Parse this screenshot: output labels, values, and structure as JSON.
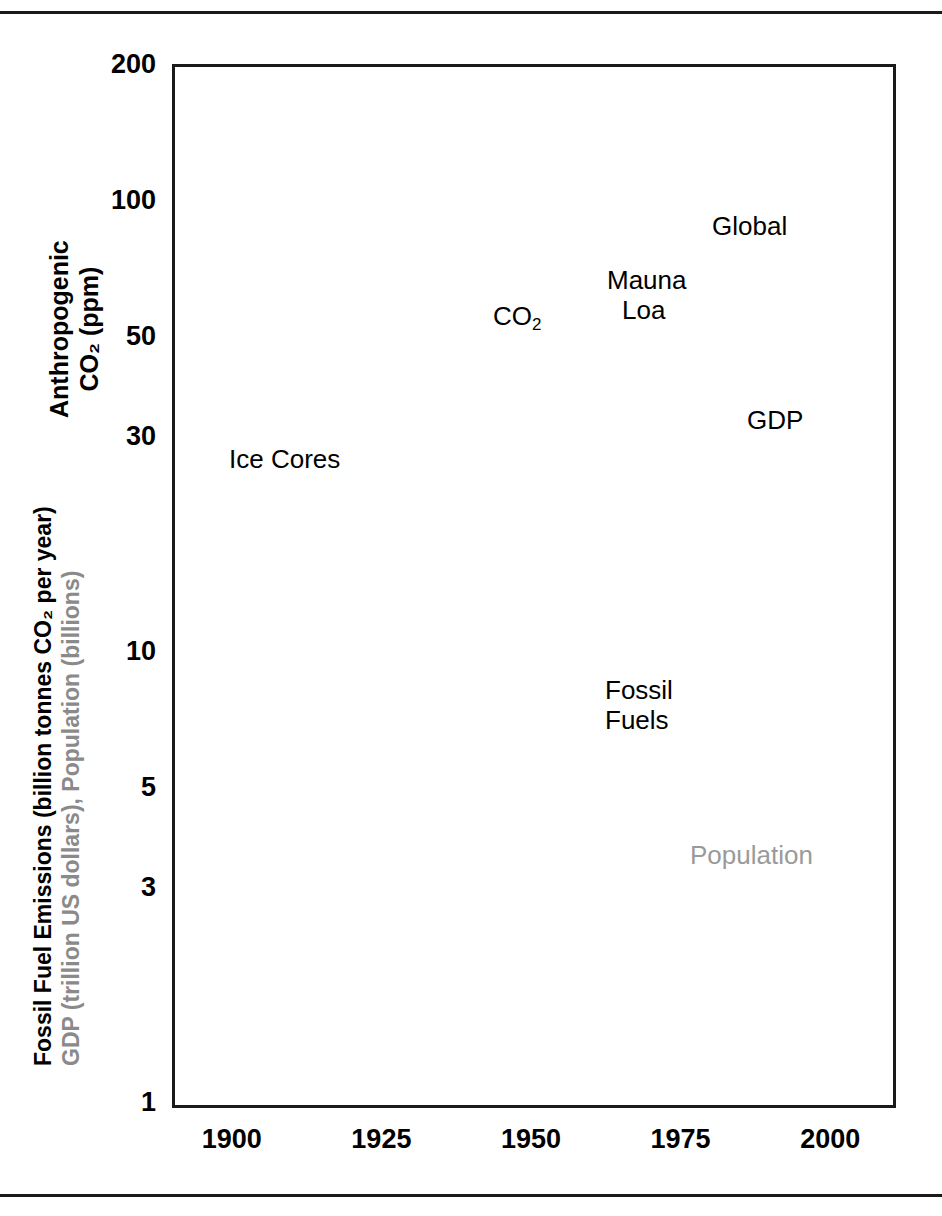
{
  "figure": {
    "rules": [
      "top-rule",
      "bottom-rule"
    ]
  },
  "axes": {
    "y_title_line1": "Anthropogenic",
    "y_title_line2": "CO₂ (ppm)",
    "y_title_fossil": "Fossil Fuel Emissions (billion tonnes CO₂ per year)",
    "y_title_gdp": "GDP (trillion US dollars), Population (billions)",
    "y_ticks": [
      "200",
      "100",
      "50",
      "30",
      "10",
      "5",
      "3",
      "1"
    ],
    "x_ticks": [
      "1900",
      "1925",
      "1950",
      "1975",
      "2000"
    ],
    "y_scale": "log",
    "x_scale": "linear"
  },
  "annotations": [
    {
      "id": "ice-cores",
      "text": "Ice Cores",
      "color": "#000000"
    },
    {
      "id": "co2",
      "text": "CO",
      "sub": "2",
      "color": "#000000"
    },
    {
      "id": "mauna-loa-1",
      "text": "Mauna",
      "color": "#000000"
    },
    {
      "id": "mauna-loa-2",
      "text": "Loa",
      "color": "#000000"
    },
    {
      "id": "global",
      "text": "Global",
      "color": "#000000"
    },
    {
      "id": "gdp",
      "text": "GDP",
      "color": "#000000"
    },
    {
      "id": "fossil-1",
      "text": "Fossil",
      "color": "#000000"
    },
    {
      "id": "fossil-2",
      "text": "Fuels",
      "color": "#000000"
    },
    {
      "id": "population",
      "text": "Population",
      "color": "#9a9a9a"
    }
  ],
  "colors": {
    "ink": "#000000",
    "gdp_grey": "#585858",
    "population_grey": "#808080",
    "annotation_grey": "#9a9a9a",
    "frame": "#1a1a1a",
    "gridline": "#b8b8b8",
    "minor_gridline": "#d8d8d8"
  },
  "chart_data": {
    "type": "scatter",
    "title": "",
    "xlabel": "",
    "ylabel": "Anthropogenic CO2 (ppm) / Fossil Fuel Emissions (billion tonnes CO2 per year) / GDP (trillion US dollars), Population (billions)",
    "xlim": [
      1890,
      2010
    ],
    "ylim": [
      1,
      200
    ],
    "yscale": "log",
    "xscale": "linear",
    "grid": true,
    "legend": "in-plot annotations",
    "xticks": [
      1900,
      1925,
      1950,
      1975,
      2000
    ],
    "yticks": [
      1,
      3,
      5,
      10,
      30,
      50,
      100,
      200
    ],
    "series": [
      {
        "name": "Ice Cores",
        "marker": "circle-with-errorbars",
        "color": "#000000",
        "units": "ppm anthropogenic CO2",
        "points": [
          {
            "x": 1891,
            "y": 16.2,
            "err": 2.2
          },
          {
            "x": 1893,
            "y": 16.4,
            "err": 2.2
          },
          {
            "x": 1898,
            "y": 16.3,
            "err": 2.4
          },
          {
            "x": 1900,
            "y": 18.4,
            "err": 2.0
          },
          {
            "x": 1905,
            "y": 20.2,
            "err": 1.8
          },
          {
            "x": 1910,
            "y": 22.2,
            "err": 1.6
          },
          {
            "x": 1915,
            "y": 22.6,
            "err": 1.6
          },
          {
            "x": 1922,
            "y": 24.6,
            "err": 1.5
          },
          {
            "x": 1925,
            "y": 25.0,
            "err": 1.5
          },
          {
            "x": 1928,
            "y": 25.2,
            "err": 1.5
          },
          {
            "x": 1932,
            "y": 27.6,
            "err": 1.3
          },
          {
            "x": 1934,
            "y": 28.9,
            "err": 1.3
          },
          {
            "x": 1936,
            "y": 27.8,
            "err": 1.3
          },
          {
            "x": 1939,
            "y": 30.4,
            "err": 1.2
          },
          {
            "x": 1940,
            "y": 30.6,
            "err": 1.2
          },
          {
            "x": 1941,
            "y": 30.5,
            "err": 1.2
          },
          {
            "x": 1945,
            "y": 30.1,
            "err": 1.2
          },
          {
            "x": 1950,
            "y": 30.4,
            "err": 1.2
          }
        ]
      },
      {
        "name": "CO2 transition",
        "marker": "circle",
        "color": "#000000",
        "units": "ppm anthropogenic CO2",
        "points": [
          {
            "x": 1951,
            "y": 31.5
          },
          {
            "x": 1955,
            "y": 34.5
          }
        ]
      },
      {
        "name": "Mauna Loa / Global CO2",
        "marker": "line",
        "color": "#000000",
        "units": "ppm anthropogenic CO2",
        "points": [
          {
            "x": 1958,
            "y": 37.0
          },
          {
            "x": 1959,
            "y": 37.6
          },
          {
            "x": 1960,
            "y": 38.2
          },
          {
            "x": 1961,
            "y": 38.7
          },
          {
            "x": 1962,
            "y": 39.4
          },
          {
            "x": 1963,
            "y": 40.0
          },
          {
            "x": 1964,
            "y": 40.6
          },
          {
            "x": 1965,
            "y": 41.4
          },
          {
            "x": 1966,
            "y": 42.3
          },
          {
            "x": 1967,
            "y": 43.0
          },
          {
            "x": 1968,
            "y": 43.9
          },
          {
            "x": 1969,
            "y": 45.1
          },
          {
            "x": 1970,
            "y": 46.2
          },
          {
            "x": 1971,
            "y": 47.0
          },
          {
            "x": 1972,
            "y": 48.1
          },
          {
            "x": 1973,
            "y": 49.5
          },
          {
            "x": 1974,
            "y": 50.4
          },
          {
            "x": 1975,
            "y": 51.3
          },
          {
            "x": 1976,
            "y": 52.2
          },
          {
            "x": 1977,
            "y": 53.8
          },
          {
            "x": 1978,
            "y": 55.0
          },
          {
            "x": 1979,
            "y": 56.5
          },
          {
            "x": 1980,
            "y": 58.1
          },
          {
            "x": 1981,
            "y": 59.3
          },
          {
            "x": 1982,
            "y": 60.3
          },
          {
            "x": 1983,
            "y": 61.9
          },
          {
            "x": 1984,
            "y": 63.2
          },
          {
            "x": 1985,
            "y": 64.4
          },
          {
            "x": 1986,
            "y": 65.9
          },
          {
            "x": 1987,
            "y": 67.6
          },
          {
            "x": 1988,
            "y": 69.6
          },
          {
            "x": 1989,
            "y": 71.2
          },
          {
            "x": 1990,
            "y": 72.6
          },
          {
            "x": 1991,
            "y": 74.0
          },
          {
            "x": 1992,
            "y": 75.0
          },
          {
            "x": 1993,
            "y": 76.1
          },
          {
            "x": 1994,
            "y": 77.8
          },
          {
            "x": 1995,
            "y": 79.5
          },
          {
            "x": 1996,
            "y": 81.4
          },
          {
            "x": 1997,
            "y": 83.0
          },
          {
            "x": 1998,
            "y": 85.2
          },
          {
            "x": 1999,
            "y": 86.9
          },
          {
            "x": 2000,
            "y": 88.4
          },
          {
            "x": 2001,
            "y": 90.2
          },
          {
            "x": 2002,
            "y": 92.0
          },
          {
            "x": 2003,
            "y": 94.3
          },
          {
            "x": 2004,
            "y": 96.3
          },
          {
            "x": 2005,
            "y": 98.4
          },
          {
            "x": 2006,
            "y": 100.4
          },
          {
            "x": 2007,
            "y": 102.4
          },
          {
            "x": 2008,
            "y": 104.0
          }
        ]
      },
      {
        "name": "Fossil Fuels",
        "marker": "circle",
        "color": "#000000",
        "units": "billion tonnes CO2 per year",
        "points": [
          {
            "x": 1920,
            "y": 3.45
          },
          {
            "x": 1921,
            "y": 3.0
          },
          {
            "x": 1922,
            "y": 3.15
          },
          {
            "x": 1923,
            "y": 3.55
          },
          {
            "x": 1924,
            "y": 3.6
          },
          {
            "x": 1925,
            "y": 3.62
          },
          {
            "x": 1926,
            "y": 3.55
          },
          {
            "x": 1927,
            "y": 3.9
          },
          {
            "x": 1928,
            "y": 3.85
          },
          {
            "x": 1929,
            "y": 4.05
          },
          {
            "x": 1930,
            "y": 3.7
          },
          {
            "x": 1931,
            "y": 3.35
          },
          {
            "x": 1932,
            "y": 3.1
          },
          {
            "x": 1933,
            "y": 3.25
          },
          {
            "x": 1934,
            "y": 3.5
          },
          {
            "x": 1935,
            "y": 3.65
          },
          {
            "x": 1936,
            "y": 3.95
          },
          {
            "x": 1937,
            "y": 4.2
          },
          {
            "x": 1938,
            "y": 4.05
          },
          {
            "x": 1939,
            "y": 4.3
          },
          {
            "x": 1940,
            "y": 4.5
          },
          {
            "x": 1941,
            "y": 4.6
          },
          {
            "x": 1942,
            "y": 4.55
          },
          {
            "x": 1943,
            "y": 4.7
          },
          {
            "x": 1944,
            "y": 4.65
          },
          {
            "x": 1945,
            "y": 4.1
          },
          {
            "x": 1946,
            "y": 4.3
          },
          {
            "x": 1947,
            "y": 4.75
          },
          {
            "x": 1948,
            "y": 5.05
          },
          {
            "x": 1949,
            "y": 4.95
          },
          {
            "x": 1950,
            "y": 5.3
          },
          {
            "x": 1951,
            "y": 5.7
          },
          {
            "x": 1952,
            "y": 5.8
          },
          {
            "x": 1953,
            "y": 6.0
          },
          {
            "x": 1954,
            "y": 6.1
          },
          {
            "x": 1955,
            "y": 6.7
          },
          {
            "x": 1956,
            "y": 7.1
          },
          {
            "x": 1957,
            "y": 7.4
          },
          {
            "x": 1958,
            "y": 7.6
          },
          {
            "x": 1959,
            "y": 8.0
          },
          {
            "x": 1960,
            "y": 8.4
          },
          {
            "x": 1961,
            "y": 8.5
          },
          {
            "x": 1962,
            "y": 8.9
          },
          {
            "x": 1963,
            "y": 9.4
          },
          {
            "x": 1964,
            "y": 9.9
          },
          {
            "x": 1965,
            "y": 10.3
          },
          {
            "x": 1966,
            "y": 10.8
          },
          {
            "x": 1967,
            "y": 11.2
          },
          {
            "x": 1968,
            "y": 11.8
          },
          {
            "x": 1969,
            "y": 12.5
          },
          {
            "x": 1970,
            "y": 13.4
          },
          {
            "x": 1971,
            "y": 13.9
          },
          {
            "x": 1972,
            "y": 14.5
          },
          {
            "x": 1973,
            "y": 15.4
          },
          {
            "x": 1974,
            "y": 15.3
          },
          {
            "x": 1975,
            "y": 15.2
          },
          {
            "x": 1976,
            "y": 16.1
          },
          {
            "x": 1977,
            "y": 16.6
          },
          {
            "x": 1978,
            "y": 16.8
          },
          {
            "x": 1979,
            "y": 17.6
          },
          {
            "x": 1980,
            "y": 17.4
          },
          {
            "x": 1981,
            "y": 16.9
          },
          {
            "x": 1982,
            "y": 16.8
          },
          {
            "x": 1983,
            "y": 16.9
          },
          {
            "x": 1984,
            "y": 17.5
          },
          {
            "x": 1985,
            "y": 18.0
          },
          {
            "x": 1986,
            "y": 18.5
          },
          {
            "x": 1987,
            "y": 19.0
          },
          {
            "x": 1988,
            "y": 19.7
          },
          {
            "x": 1989,
            "y": 20.0
          },
          {
            "x": 1990,
            "y": 20.2
          },
          {
            "x": 1991,
            "y": 20.3
          },
          {
            "x": 1992,
            "y": 20.1
          },
          {
            "x": 1993,
            "y": 20.2
          },
          {
            "x": 1994,
            "y": 20.5
          },
          {
            "x": 1995,
            "y": 21.0
          },
          {
            "x": 1996,
            "y": 21.5
          },
          {
            "x": 1997,
            "y": 21.8
          },
          {
            "x": 1998,
            "y": 21.9
          },
          {
            "x": 1999,
            "y": 22.0
          },
          {
            "x": 2000,
            "y": 22.6
          },
          {
            "x": 2001,
            "y": 23.0
          },
          {
            "x": 2002,
            "y": 23.4
          },
          {
            "x": 2003,
            "y": 24.6
          },
          {
            "x": 2004,
            "y": 26.0
          },
          {
            "x": 2005,
            "y": 27.2
          },
          {
            "x": 2006,
            "y": 28.4
          },
          {
            "x": 2007,
            "y": 29.6
          },
          {
            "x": 2008,
            "y": 30.8
          }
        ]
      },
      {
        "name": "GDP",
        "marker": "circle",
        "color": "#585858",
        "units": "trillion US dollars",
        "points": [
          {
            "x": 1950,
            "y": 5.3
          },
          {
            "x": 1955,
            "y": 6.9
          },
          {
            "x": 1960,
            "y": 8.8
          },
          {
            "x": 1965,
            "y": 11.5
          },
          {
            "x": 1970,
            "y": 15.2
          },
          {
            "x": 1975,
            "y": 17.5
          },
          {
            "x": 1980,
            "y": 21.0
          },
          {
            "x": 1985,
            "y": 23.0
          },
          {
            "x": 1990,
            "y": 26.5
          },
          {
            "x": 1995,
            "y": 29.2
          },
          {
            "x": 2000,
            "y": 34.0
          },
          {
            "x": 2004,
            "y": 44.5
          },
          {
            "x": 2006,
            "y": 48.5
          },
          {
            "x": 2007,
            "y": 55.5
          }
        ]
      },
      {
        "name": "Population",
        "marker": "circle",
        "color": "#808080",
        "units": "billions",
        "points": [
          {
            "x": 1900,
            "y": 1.65
          },
          {
            "x": 1910,
            "y": 1.75
          },
          {
            "x": 1920,
            "y": 1.86
          },
          {
            "x": 1930,
            "y": 2.07
          },
          {
            "x": 1940,
            "y": 2.3
          },
          {
            "x": 1950,
            "y": 2.53
          },
          {
            "x": 1955,
            "y": 2.77
          },
          {
            "x": 1960,
            "y": 3.03
          },
          {
            "x": 1965,
            "y": 3.34
          },
          {
            "x": 1970,
            "y": 3.7
          },
          {
            "x": 1975,
            "y": 4.07
          },
          {
            "x": 1980,
            "y": 4.44
          },
          {
            "x": 1985,
            "y": 4.84
          },
          {
            "x": 1990,
            "y": 5.27
          },
          {
            "x": 1995,
            "y": 5.68
          },
          {
            "x": 2000,
            "y": 6.07
          },
          {
            "x": 2005,
            "y": 6.45
          },
          {
            "x": 2007,
            "y": 6.6
          }
        ]
      }
    ]
  }
}
